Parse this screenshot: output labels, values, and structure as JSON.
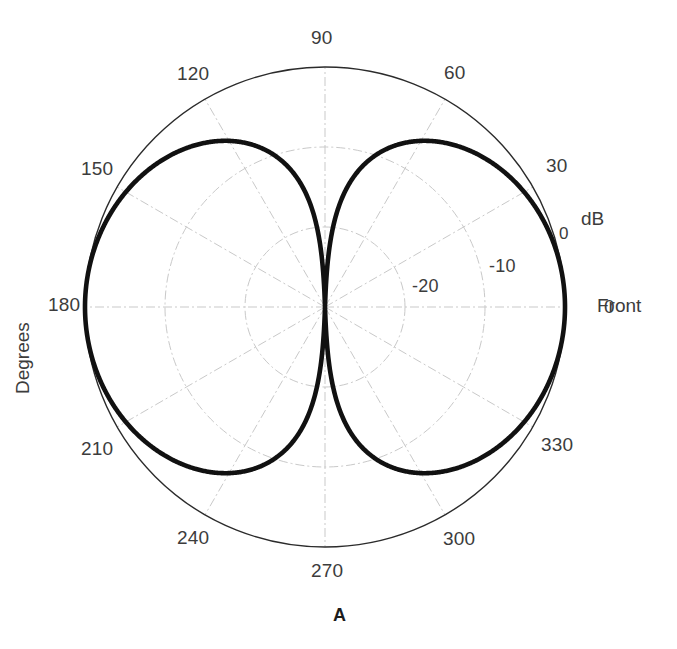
{
  "figure": {
    "caption": "A",
    "angular_axis_title": "Degrees",
    "radial_axis_title": "dB",
    "front_label": "Front",
    "front_tick": "0"
  },
  "chart_data": {
    "type": "line",
    "plot_style": "polar",
    "title": "A",
    "xlabel": "Degrees",
    "ylabel": "dB",
    "angle_unit": "degrees",
    "grid": true,
    "legend": "none",
    "angle_ticks": [
      "0",
      "30",
      "60",
      "90",
      "120",
      "150",
      "180",
      "210",
      "240",
      "270",
      "300",
      "330"
    ],
    "angle_tick_values": [
      0,
      30,
      60,
      90,
      120,
      150,
      180,
      210,
      240,
      270,
      300,
      330
    ],
    "radial_ticks": [
      "0",
      "-10",
      "-20"
    ],
    "radial_tick_values": [
      0,
      -10,
      -20
    ],
    "rlim": [
      -30,
      0
    ],
    "annotations": [
      "Front",
      "dB",
      "Degrees"
    ],
    "series": [
      {
        "name": "radiation pattern",
        "theta": [
          0,
          5,
          10,
          15,
          20,
          25,
          30,
          35,
          40,
          45,
          50,
          55,
          60,
          65,
          70,
          75,
          80,
          85,
          88,
          90,
          92,
          95,
          100,
          105,
          110,
          115,
          120,
          125,
          130,
          135,
          140,
          145,
          150,
          155,
          160,
          165,
          170,
          175,
          180,
          185,
          190,
          195,
          200,
          205,
          210,
          215,
          220,
          225,
          230,
          235,
          240,
          245,
          250,
          255,
          260,
          265,
          268,
          270,
          272,
          275,
          280,
          285,
          290,
          295,
          300,
          305,
          310,
          315,
          320,
          325,
          330,
          335,
          340,
          345,
          350,
          355,
          360
        ],
        "values_db": [
          0,
          -0.02,
          -0.08,
          -0.18,
          -0.32,
          -0.51,
          -0.75,
          -1.05,
          -1.42,
          -1.87,
          -2.42,
          -3.09,
          -3.92,
          -4.95,
          -6.27,
          -8.0,
          -10.4,
          -14.2,
          -18.0,
          -30,
          -18.0,
          -14.2,
          -10.4,
          -8.0,
          -6.27,
          -4.95,
          -3.92,
          -3.09,
          -2.42,
          -1.87,
          -1.42,
          -1.05,
          -0.75,
          -0.51,
          -0.32,
          -0.18,
          -0.08,
          -0.02,
          0,
          -0.02,
          -0.08,
          -0.18,
          -0.32,
          -0.51,
          -0.75,
          -1.05,
          -1.42,
          -1.87,
          -2.42,
          -3.09,
          -3.92,
          -4.95,
          -6.27,
          -8.0,
          -10.4,
          -14.2,
          -18.0,
          -30,
          -18.0,
          -14.2,
          -10.4,
          -8.0,
          -6.27,
          -4.95,
          -3.92,
          -3.09,
          -2.42,
          -1.87,
          -1.42,
          -1.05,
          -0.75,
          -0.51,
          -0.32,
          -0.18,
          -0.08,
          -0.02,
          0
        ],
        "description": "figure-eight dipole pattern, peaks at 0 and 180 degrees, deep nulls at 90 and 270 degrees"
      }
    ]
  },
  "labels": {
    "a0": "0",
    "a30": "30",
    "a60": "60",
    "a90": "90",
    "a120": "120",
    "a150": "150",
    "a180": "180",
    "a210": "210",
    "a240": "240",
    "a270": "270",
    "a300": "300",
    "a330": "330",
    "r0": "0",
    "rm10": "-10",
    "rm20": "-20"
  },
  "colors": {
    "curve": "#111111",
    "outline": "#222222",
    "grid": "#cccccc",
    "text": "#3c3c3c",
    "background": "#ffffff"
  }
}
